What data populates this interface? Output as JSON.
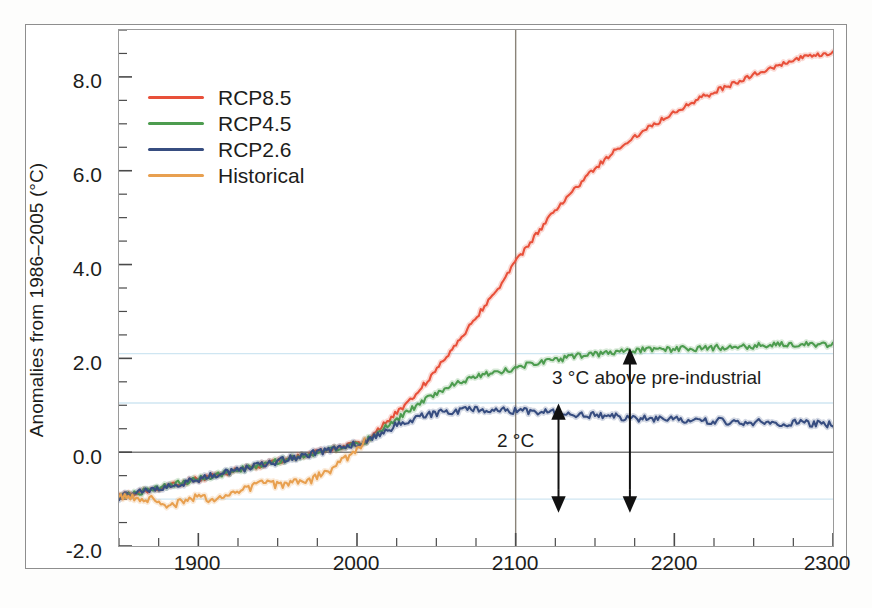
{
  "chart_data": {
    "type": "line",
    "title": "",
    "subtitle": "",
    "xlabel": "",
    "ylabel": "Anomalies from 1986–2005 (°C)",
    "xlim": [
      1850,
      2300
    ],
    "ylim": [
      -2.0,
      9.0
    ],
    "grid": true,
    "gridlines_horizontal": [
      2.1,
      1.05,
      -1.0
    ],
    "gridline_color": "#cfe6f2",
    "zero_line": 0.0,
    "zero_line_color": "#7d7d7d",
    "vertical_reference_lines": [
      2100
    ],
    "vertical_line_color": "#8a8379",
    "xticks": [
      1900,
      2000,
      2100,
      2200,
      2300
    ],
    "xticks_minor_interval": 25,
    "yticks": [
      -2.0,
      0.0,
      2.0,
      4.0,
      6.0,
      8.0
    ],
    "ytick_labels": [
      "-2.0",
      "0.0",
      "2.0",
      "4.0",
      "6.0",
      "8.0"
    ],
    "yticks_minor_interval": 0.5,
    "legend_position": "upper-left",
    "series": [
      {
        "name": "RCP8.5",
        "color": "#e8503a",
        "x": [
          1850,
          2005,
          2010,
          2020,
          2030,
          2040,
          2050,
          2060,
          2070,
          2080,
          2090,
          2100,
          2110,
          2120,
          2130,
          2140,
          2150,
          2160,
          2170,
          2180,
          2190,
          2200,
          2210,
          2220,
          2230,
          2240,
          2250,
          2260,
          2270,
          2280,
          2290,
          2300
        ],
        "values": [
          -0.95,
          0.22,
          0.38,
          0.68,
          1.0,
          1.35,
          1.75,
          2.2,
          2.65,
          3.1,
          3.55,
          4.05,
          4.5,
          4.95,
          5.35,
          5.7,
          6.05,
          6.35,
          6.6,
          6.85,
          7.05,
          7.25,
          7.45,
          7.6,
          7.75,
          7.9,
          8.05,
          8.15,
          8.3,
          8.4,
          8.45,
          8.5
        ]
      },
      {
        "name": "RCP4.5",
        "color": "#4d9c4f",
        "x": [
          1850,
          2005,
          2010,
          2020,
          2030,
          2040,
          2050,
          2060,
          2070,
          2080,
          2090,
          2100,
          2120,
          2140,
          2160,
          2180,
          2200,
          2220,
          2240,
          2260,
          2280,
          2300
        ],
        "values": [
          -0.95,
          0.22,
          0.35,
          0.58,
          0.82,
          1.05,
          1.25,
          1.42,
          1.55,
          1.65,
          1.72,
          1.8,
          1.95,
          2.05,
          2.12,
          2.18,
          2.2,
          2.22,
          2.25,
          2.28,
          2.3,
          2.3
        ]
      },
      {
        "name": "RCP2.6",
        "color": "#374d80",
        "x": [
          1850,
          2005,
          2010,
          2020,
          2030,
          2040,
          2050,
          2060,
          2070,
          2080,
          2090,
          2100,
          2120,
          2140,
          2160,
          2180,
          2200,
          2220,
          2240,
          2260,
          2280,
          2300
        ],
        "values": [
          -0.95,
          0.22,
          0.33,
          0.5,
          0.64,
          0.75,
          0.83,
          0.88,
          0.9,
          0.9,
          0.9,
          0.88,
          0.85,
          0.8,
          0.76,
          0.72,
          0.7,
          0.67,
          0.65,
          0.63,
          0.62,
          0.6
        ]
      },
      {
        "name": "Historical",
        "color": "#e8a050",
        "x": [
          1850,
          1860,
          1870,
          1880,
          1890,
          1900,
          1910,
          1920,
          1930,
          1940,
          1950,
          1960,
          1970,
          1980,
          1990,
          2000,
          2005
        ],
        "values": [
          -0.98,
          -0.95,
          -1.0,
          -1.18,
          -1.05,
          -0.95,
          -1.0,
          -0.9,
          -0.78,
          -0.65,
          -0.7,
          -0.65,
          -0.6,
          -0.45,
          -0.2,
          0.05,
          0.22
        ]
      }
    ],
    "annotations": [
      {
        "text": "3 °C above pre-industrial",
        "arrow": "double-vertical",
        "x": 2172,
        "y_top": 2.1,
        "y_bottom": -1.0
      },
      {
        "text": "2 °C",
        "arrow": "double-vertical",
        "x": 2127,
        "y_top": 0.92,
        "y_bottom": -1.0
      }
    ]
  },
  "legend": {
    "items": [
      {
        "label": "RCP8.5",
        "color": "#e8503a"
      },
      {
        "label": "RCP4.5",
        "color": "#4d9c4f"
      },
      {
        "label": "RCP2.6",
        "color": "#374d80"
      },
      {
        "label": "Historical",
        "color": "#e8a050"
      }
    ]
  },
  "axes": {
    "y_title": "Anomalies from 1986–2005 (°C)",
    "y_tick_labels": [
      "8.0",
      "6.0",
      "4.0",
      "2.0",
      "0.0",
      "-2.0"
    ],
    "x_tick_labels": [
      "1900",
      "2000",
      "2100",
      "2200",
      "2300"
    ]
  },
  "annotations": {
    "three_c": "3 °C above pre-industrial",
    "two_c": "2 °C"
  }
}
